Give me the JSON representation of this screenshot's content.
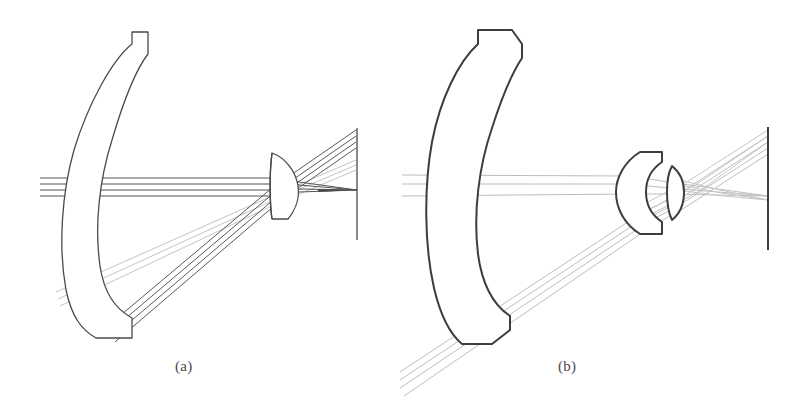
{
  "figure": {
    "background_color": "#ffffff",
    "ink_color": "#4a4a4a",
    "ray_dark_color": "#555555",
    "ray_faint_color": "#bcbcbc",
    "width": 800,
    "height": 403
  },
  "panels": [
    {
      "id": "a",
      "caption": "(a)",
      "caption_x": 175,
      "caption_y": 358,
      "components": [
        {
          "name": "primary-mirror",
          "kind": "curved-meniscus-mirror",
          "x": 42,
          "y": 28,
          "width": 100,
          "height": 310
        },
        {
          "name": "corrector-lens",
          "kind": "biconvex-lens",
          "x": 270,
          "y": 152,
          "width": 30,
          "height": 66
        },
        {
          "name": "image-plane",
          "kind": "vertical-line",
          "x": 357,
          "y_top": 128,
          "y_bottom": 240
        }
      ],
      "ray_bundles": [
        {
          "name": "on-axis-bundle",
          "shade": "dark",
          "description": "three horizontal rays along the optical axis entering from the left through the mirror and converging at the axial image point"
        },
        {
          "name": "off-axis-bundle",
          "shade": "dark",
          "description": "rays reflected from the lower mirror edge up through the lens to the upper field point"
        },
        {
          "name": "off-axis-bundle-faint",
          "shade": "faint",
          "description": "second faint fan from the lower mirror region to an intermediate field height"
        }
      ]
    },
    {
      "id": "b",
      "caption": "(b)",
      "caption_x": 558,
      "caption_y": 358,
      "components": [
        {
          "name": "primary-mirror",
          "kind": "curved-meniscus-mirror",
          "x": 427,
          "y": 28,
          "width": 95,
          "height": 315
        },
        {
          "name": "field-lens",
          "kind": "plano-convex-lens",
          "x": 630,
          "y": 152,
          "width": 33,
          "height": 80
        },
        {
          "name": "relay-lens",
          "kind": "biconvex-lens",
          "x": 668,
          "y": 165,
          "width": 17,
          "height": 52
        },
        {
          "name": "image-plane",
          "kind": "vertical-line",
          "x": 768,
          "y_top": 127,
          "y_bottom": 250
        }
      ],
      "ray_bundles": [
        {
          "name": "on-axis-bundle",
          "shade": "faint",
          "description": "three near-horizontal rays crossing the mirror and the lens group to the image plane"
        },
        {
          "name": "off-axis-bundle-lower",
          "shade": "faint",
          "description": "tilted fan entering from lower left past the mirror edge into the lens group and crossing up to the image plane"
        },
        {
          "name": "off-axis-bundle-upper",
          "shade": "faint",
          "description": "fan leaving the lens group upward to the top of the image plane"
        }
      ]
    }
  ]
}
